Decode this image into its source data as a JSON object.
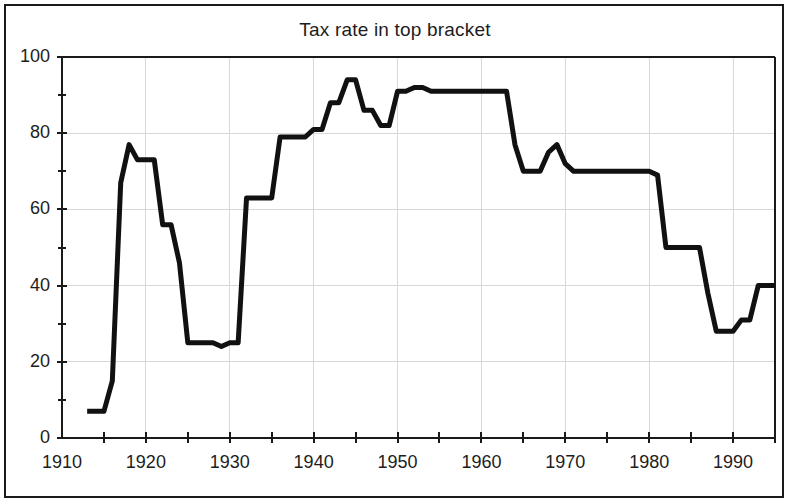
{
  "figure": {
    "title": "Tax rate in top bracket",
    "background_color": "#ffffff",
    "frame_color": "#1a1a1a",
    "line_color": "#111111",
    "grid_color": "#d8d8d8",
    "axis_color": "#1a1a1a"
  },
  "chart_data": {
    "type": "line",
    "title": "Tax rate in top bracket",
    "xlabel": "",
    "ylabel": "",
    "xlim": [
      1910,
      1995
    ],
    "ylim": [
      0,
      100
    ],
    "grid": true,
    "legend": null,
    "x_major_ticks": [
      1910,
      1920,
      1930,
      1940,
      1950,
      1960,
      1970,
      1980,
      1990
    ],
    "x_minor_ticks": [
      1915,
      1925,
      1935,
      1945,
      1955,
      1965,
      1975,
      1985,
      1995
    ],
    "x_tick_labels": [
      "1910",
      "1920",
      "1930",
      "1940",
      "1950",
      "1960",
      "1970",
      "1980",
      "1990"
    ],
    "y_major_ticks": [
      0,
      20,
      40,
      60,
      80,
      100
    ],
    "y_minor_ticks": [
      10,
      30,
      50,
      70,
      90
    ],
    "y_tick_labels": [
      "0",
      "20",
      "40",
      "60",
      "80",
      "100"
    ],
    "series": [
      {
        "name": "Top marginal tax rate",
        "x": [
          1913,
          1914,
          1915,
          1916,
          1917,
          1918,
          1919,
          1920,
          1921,
          1922,
          1923,
          1924,
          1925,
          1926,
          1927,
          1928,
          1929,
          1930,
          1931,
          1932,
          1933,
          1934,
          1935,
          1936,
          1937,
          1938,
          1939,
          1940,
          1941,
          1942,
          1943,
          1944,
          1945,
          1946,
          1947,
          1948,
          1949,
          1950,
          1951,
          1952,
          1953,
          1954,
          1955,
          1956,
          1957,
          1958,
          1959,
          1960,
          1961,
          1962,
          1963,
          1964,
          1965,
          1966,
          1967,
          1968,
          1969,
          1970,
          1971,
          1972,
          1973,
          1974,
          1975,
          1976,
          1977,
          1978,
          1979,
          1980,
          1981,
          1982,
          1983,
          1984,
          1985,
          1986,
          1987,
          1988,
          1989,
          1990,
          1991,
          1992,
          1993,
          1994,
          1995
        ],
        "y": [
          7,
          7,
          7,
          15,
          67,
          77,
          73,
          73,
          73,
          56,
          56,
          46,
          25,
          25,
          25,
          25,
          24,
          25,
          25,
          63,
          63,
          63,
          63,
          79,
          79,
          79,
          79,
          81,
          81,
          88,
          88,
          94,
          94,
          86,
          86,
          82,
          82,
          91,
          91,
          92,
          92,
          91,
          91,
          91,
          91,
          91,
          91,
          91,
          91,
          91,
          91,
          77,
          70,
          70,
          70,
          75,
          77,
          72,
          70,
          70,
          70,
          70,
          70,
          70,
          70,
          70,
          70,
          70,
          69,
          50,
          50,
          50,
          50,
          50,
          38,
          28,
          28,
          28,
          31,
          31,
          40,
          40,
          40
        ]
      }
    ]
  },
  "axes": {
    "y_labels": [
      "100",
      "80",
      "60",
      "40",
      "20",
      "0"
    ],
    "x_labels": [
      "1910",
      "1920",
      "1930",
      "1940",
      "1950",
      "1960",
      "1970",
      "1980",
      "1990"
    ]
  }
}
